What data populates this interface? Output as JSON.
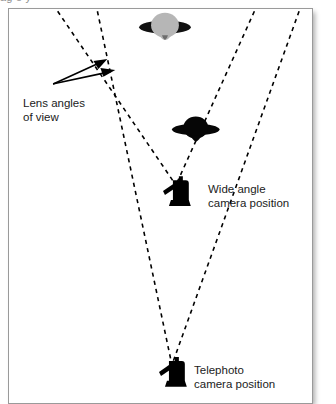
{
  "figure": {
    "cut_off_caption": "ag          o  y",
    "background_color": "#ffffff",
    "border_color": "#9a9a9a",
    "ink_color": "#000000",
    "object_fill_gray": "#b0b0b0"
  },
  "labels": {
    "lens_angles": {
      "line1": "Lens angles",
      "line2": "of view"
    },
    "wide_camera": {
      "line1": "Wide angle",
      "line2": "camera position"
    },
    "telephoto_camera": {
      "line1": "Telephoto",
      "line2": "camera position"
    }
  },
  "scene": {
    "cameras": [
      {
        "name": "wide-angle-camera",
        "x": 176,
        "y": 188
      },
      {
        "name": "telephoto-camera",
        "x": 172,
        "y": 372
      }
    ],
    "subjects": [
      {
        "name": "distant-tree",
        "x": 165,
        "y": 25,
        "fill": "#b0b0b0"
      },
      {
        "name": "near-tree",
        "x": 196,
        "y": 128,
        "fill": "#000000"
      }
    ],
    "view_cones": [
      {
        "name": "wide-angle-cone",
        "apex": {
          "x": 176,
          "y": 185
        },
        "left_edge_top": {
          "x": 57,
          "y": 10
        },
        "right_edge_top": {
          "x": 255,
          "y": 10
        },
        "style": "dashed"
      },
      {
        "name": "telephoto-cone",
        "apex": {
          "x": 172,
          "y": 366
        },
        "left_edge_top": {
          "x": 97,
          "y": 10
        },
        "right_edge_top": {
          "x": 300,
          "y": 10
        },
        "style": "dashed"
      }
    ],
    "annotation_arrows": {
      "name": "lens-angle-arrows",
      "origin": {
        "x": 53,
        "y": 83
      },
      "tips": [
        {
          "x": 105,
          "y": 60
        },
        {
          "x": 111,
          "y": 70
        }
      ]
    }
  }
}
